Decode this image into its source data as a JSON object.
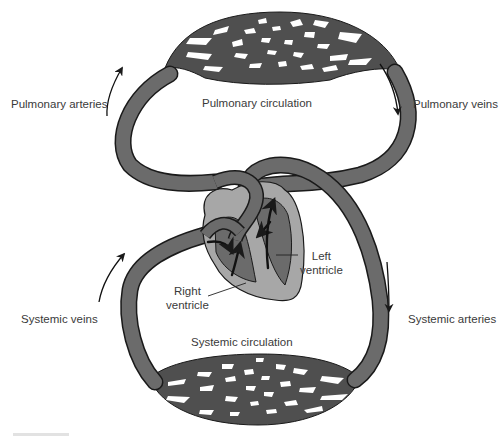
{
  "diagram": {
    "colors": {
      "vessel": "#6b6b6b",
      "vessel_outline": "#1a1a1a",
      "heart_outer": "#a7a7a7",
      "heart_chamber": "#6b6b6b",
      "capillary_bed": "#4f4f4f",
      "background": "#ffffff",
      "text": "#3a3a3a"
    },
    "labels": {
      "pulmonary_arteries": "Pulmonary arteries",
      "pulmonary_circulation": "Pulmonary circulation",
      "pulmonary_veins": "Pulmonary veins",
      "left_ventricle_line1": "Left",
      "left_ventricle_line2": "ventricle",
      "right_ventricle_line1": "Right",
      "right_ventricle_line2": "ventricle",
      "systemic_veins": "Systemic veins",
      "systemic_arteries": "Systemic arteries",
      "systemic_circulation": "Systemic circulation"
    },
    "nodes": [
      {
        "id": "pulmonary-capillary-bed",
        "label": "Pulmonary circulation"
      },
      {
        "id": "systemic-capillary-bed",
        "label": "Systemic circulation"
      },
      {
        "id": "heart",
        "label": "Heart"
      },
      {
        "id": "right-ventricle",
        "label": "Right ventricle"
      },
      {
        "id": "left-ventricle",
        "label": "Left ventricle"
      }
    ],
    "edges": [
      {
        "from": "right-ventricle",
        "to": "pulmonary-capillary-bed",
        "label": "Pulmonary arteries",
        "direction": "up"
      },
      {
        "from": "pulmonary-capillary-bed",
        "to": "left-ventricle",
        "label": "Pulmonary veins",
        "direction": "down"
      },
      {
        "from": "left-ventricle",
        "to": "systemic-capillary-bed",
        "label": "Systemic arteries",
        "direction": "down"
      },
      {
        "from": "systemic-capillary-bed",
        "to": "right-ventricle",
        "label": "Systemic veins",
        "direction": "up"
      }
    ]
  }
}
